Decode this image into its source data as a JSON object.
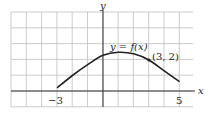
{
  "chart_data": {
    "type": "line",
    "title": "",
    "xlabel": "x",
    "ylabel": "y",
    "curve_label": "y = f(x)",
    "point_label": "(3, 2)",
    "marked_point": {
      "x": 3,
      "y": 2
    },
    "x_tick_labels": [
      "−3",
      "5"
    ],
    "xlim": [
      -6,
      6
    ],
    "ylim": [
      -1,
      5
    ],
    "grid": true,
    "series": [
      {
        "name": "y = f(x)",
        "x": [
          -3,
          -2,
          -1,
          0,
          1,
          2,
          3,
          4,
          5
        ],
        "y": [
          0.2,
          1.0,
          1.7,
          2.3,
          2.5,
          2.4,
          2.0,
          1.3,
          0.6
        ]
      }
    ],
    "colors": {
      "curve": "#222222",
      "grid": "#bfbfbf",
      "axis": "#333333"
    }
  }
}
